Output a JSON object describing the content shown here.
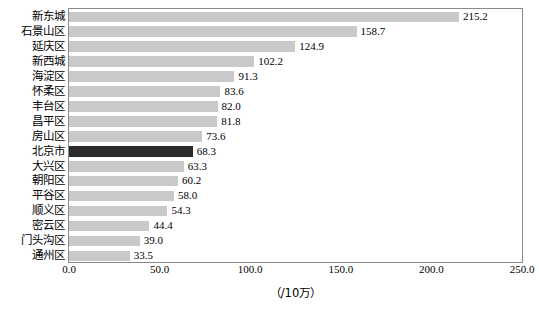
{
  "chart_data": {
    "type": "bar",
    "orientation": "horizontal",
    "title": "",
    "subtitle": "",
    "xlabel": "（/10万）",
    "ylabel": "",
    "xlim": [
      0,
      250
    ],
    "xticks": [
      "0.0",
      "50.0",
      "100.0",
      "150.0",
      "200.0",
      "250.0"
    ],
    "xtick_values": [
      0,
      50,
      100,
      150,
      200,
      250
    ],
    "grid": false,
    "legend": "none",
    "highlight_category": "北京市",
    "colors": {
      "bar": "#c9c9c9",
      "bar_highlight": "#2b2b2b",
      "frame": "#8a8a8a",
      "text": "#000000"
    },
    "categories": [
      "新东城",
      "石景山区",
      "延庆区",
      "新西城",
      "海淀区",
      "怀柔区",
      "丰台区",
      "昌平区",
      "房山区",
      "北京市",
      "大兴区",
      "朝阳区",
      "平谷区",
      "顺义区",
      "密云区",
      "门头沟区",
      "通州区"
    ],
    "values": [
      215.2,
      158.7,
      124.9,
      102.2,
      91.3,
      83.6,
      82.0,
      81.8,
      73.6,
      68.3,
      63.3,
      60.2,
      58.0,
      54.3,
      44.4,
      39.0,
      33.5
    ],
    "value_labels": [
      "215.2",
      "158.7",
      "124.9",
      "102.2",
      "91.3",
      "83.6",
      "82.0",
      "81.8",
      "73.6",
      "68.3",
      "63.3",
      "60.2",
      "58.0",
      "54.3",
      "44.4",
      "39.0",
      "33.5"
    ]
  }
}
